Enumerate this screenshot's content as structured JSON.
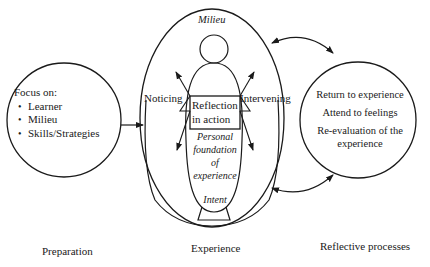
{
  "preparation": {
    "heading": "Focus on:",
    "items": [
      "Learner",
      "Milieu",
      "Skills/Strategies"
    ],
    "caption": "Preparation"
  },
  "experience": {
    "milieu_label": "Milieu",
    "noticing_label": "Noticing",
    "intervening_label": "Intervening",
    "reflection_box": [
      "Reflection",
      "in action"
    ],
    "personal_foundation": [
      "Personal",
      "foundation",
      "of",
      "experience"
    ],
    "intent_label": "Intent",
    "caption": "Experience"
  },
  "reflective": {
    "items": [
      "Return to experience",
      "Attend to feelings",
      "Re-evaluation of the experience"
    ],
    "caption": "Reflective processes"
  },
  "colors": {
    "stroke": "#1a1a1a",
    "background": "#ffffff"
  }
}
